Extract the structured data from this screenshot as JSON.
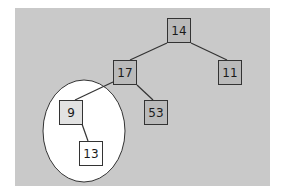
{
  "diagram": {
    "type": "binary-tree",
    "colors": {
      "panel_background": "#c9c9c9",
      "node_fill": "#bababa",
      "node_fill_highlight": "#e2e2e2",
      "node_fill_white": "#ffffff",
      "edge": "#333333",
      "ellipse_fill": "#ffffff"
    },
    "nodes": [
      {
        "id": "n14",
        "label": "14",
        "parent": null
      },
      {
        "id": "n17",
        "label": "17",
        "parent": "n14"
      },
      {
        "id": "n11",
        "label": "11",
        "parent": "n14"
      },
      {
        "id": "n9",
        "label": "9",
        "parent": "n17"
      },
      {
        "id": "n53",
        "label": "53",
        "parent": "n17"
      },
      {
        "id": "n13",
        "label": "13",
        "parent": "n9"
      }
    ],
    "edges": [
      {
        "from": "14",
        "to": "17"
      },
      {
        "from": "14",
        "to": "11"
      },
      {
        "from": "17",
        "to": "9"
      },
      {
        "from": "17",
        "to": "53"
      },
      {
        "from": "9",
        "to": "13"
      }
    ],
    "highlight": {
      "shape": "ellipse",
      "encloses": [
        "9",
        "13"
      ]
    }
  }
}
